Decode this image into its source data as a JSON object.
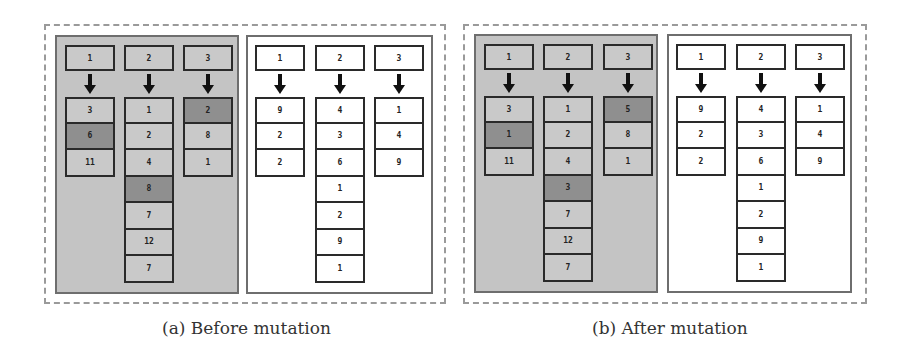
{
  "figures": [
    {
      "id": "a",
      "caption": "(a) Before mutation",
      "gray_group": {
        "columns": [
          {
            "header": "1",
            "cells": [
              {
                "v": "3",
                "hl": false
              },
              {
                "v": "6",
                "hl": true
              },
              {
                "v": "11",
                "hl": false
              }
            ]
          },
          {
            "header": "2",
            "cells": [
              {
                "v": "1",
                "hl": false
              },
              {
                "v": "2",
                "hl": false
              },
              {
                "v": "4",
                "hl": false
              },
              {
                "v": "8",
                "hl": true
              },
              {
                "v": "7",
                "hl": false
              },
              {
                "v": "12",
                "hl": false
              },
              {
                "v": "7",
                "hl": false
              }
            ]
          },
          {
            "header": "3",
            "cells": [
              {
                "v": "2",
                "hl": true
              },
              {
                "v": "8",
                "hl": false
              },
              {
                "v": "1",
                "hl": false
              }
            ]
          }
        ]
      },
      "white_group": {
        "columns": [
          {
            "header": "1",
            "cells": [
              {
                "v": "9"
              },
              {
                "v": "2"
              },
              {
                "v": "2"
              }
            ]
          },
          {
            "header": "2",
            "cells": [
              {
                "v": "4"
              },
              {
                "v": "3"
              },
              {
                "v": "6"
              },
              {
                "v": "1"
              },
              {
                "v": "2"
              },
              {
                "v": "9"
              },
              {
                "v": "1"
              }
            ]
          },
          {
            "header": "3",
            "cells": [
              {
                "v": "1"
              },
              {
                "v": "4"
              },
              {
                "v": "9"
              }
            ]
          }
        ]
      }
    },
    {
      "id": "b",
      "caption": "(b) After mutation",
      "gray_group": {
        "columns": [
          {
            "header": "1",
            "cells": [
              {
                "v": "3",
                "hl": false
              },
              {
                "v": "1",
                "hl": true
              },
              {
                "v": "11",
                "hl": false
              }
            ]
          },
          {
            "header": "2",
            "cells": [
              {
                "v": "1",
                "hl": false
              },
              {
                "v": "2",
                "hl": false
              },
              {
                "v": "4",
                "hl": false
              },
              {
                "v": "3",
                "hl": true
              },
              {
                "v": "7",
                "hl": false
              },
              {
                "v": "12",
                "hl": false
              },
              {
                "v": "7",
                "hl": false
              }
            ]
          },
          {
            "header": "3",
            "cells": [
              {
                "v": "5",
                "hl": true
              },
              {
                "v": "8",
                "hl": false
              },
              {
                "v": "1",
                "hl": false
              }
            ]
          }
        ]
      },
      "white_group": {
        "columns": [
          {
            "header": "1",
            "cells": [
              {
                "v": "9"
              },
              {
                "v": "2"
              },
              {
                "v": "2"
              }
            ]
          },
          {
            "header": "2",
            "cells": [
              {
                "v": "4"
              },
              {
                "v": "3"
              },
              {
                "v": "6"
              },
              {
                "v": "1"
              },
              {
                "v": "2"
              },
              {
                "v": "9"
              },
              {
                "v": "1"
              }
            ]
          },
          {
            "header": "3",
            "cells": [
              {
                "v": "1"
              },
              {
                "v": "4"
              },
              {
                "v": "9"
              }
            ]
          }
        ]
      }
    }
  ],
  "colors": {
    "gray_panel": "#c4c4c4",
    "highlight_cell": "#8f8f8f",
    "white_panel": "#ffffff",
    "border": "#2a2a2a",
    "dashed_frame": "#9a9a9a"
  }
}
